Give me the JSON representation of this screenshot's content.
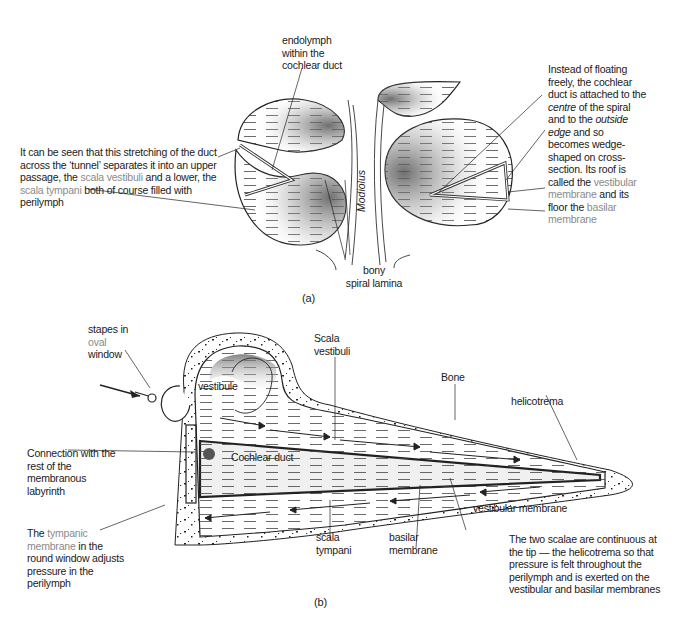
{
  "figure_a": {
    "caption": "(a)",
    "labels": {
      "endolymph": [
        "endolymph",
        "within the",
        "cochlear duct"
      ],
      "tunnel_text": {
        "line1": "It can be seen that this stretching of the duct",
        "line2": "across the ‘tunnel’ separates it into an upper",
        "line3_pre": "passage, the ",
        "line3_term": "scala vestibuli",
        "line3_post": " and a lower, the",
        "line4_term": "scala tympani",
        "line4_post": " both of course filled with",
        "line5": "perilymph"
      },
      "modiolus": "Modiolus",
      "bony_spiral_lamina": [
        "bony",
        "spiral lamina"
      ],
      "right_text": {
        "l1": "Instead of floating",
        "l2": "freely, the cochlear",
        "l3": "duct is attached to the",
        "l4_it": "centre",
        "l4_post": " of the spiral",
        "l5_pre": "and to the ",
        "l5_it": "outside",
        "l6_it": "edge",
        "l6_post": " and so",
        "l7": "becomes wedge-",
        "l8": "shaped on cross-",
        "l9": "section. Its roof is",
        "l10_pre": "called the ",
        "l10_term": "vestibular",
        "l11_term": "membrane",
        "l11_post": " and its",
        "l12_pre": "floor the ",
        "l12_term": "basilar",
        "l13_term": "membrane"
      }
    }
  },
  "figure_b": {
    "caption": "(b)",
    "labels": {
      "stapes": {
        "l1": "stapes in",
        "l2_term": "oval",
        "l3": "window"
      },
      "vestibule": "vestibule",
      "scala_vestibuli": [
        "Scala",
        "vestibuli"
      ],
      "bone": "Bone",
      "helicotrema": "helicotrema",
      "connection": [
        "Connection with the",
        "rest of the",
        "membranous",
        "labyrinth"
      ],
      "cochlear_duct": "Cochlear duct",
      "tympanic": {
        "l1_pre": "The ",
        "l1_term": "tympanic",
        "l2_term": "membrane",
        "l2_post": " in the",
        "l3": "round window adjusts",
        "l4": "pressure in the",
        "l5": "perilymph"
      },
      "scala_tympani": [
        "scala",
        "tympani"
      ],
      "basilar_membrane": [
        "basilar",
        "membrane"
      ],
      "vestibular_membrane": "vestibular membrane",
      "note": [
        "The two scalae are continuous at",
        "the tip — the helicotrema so that",
        "pressure is felt throughout the",
        "perilymph and is exerted on the",
        "vestibular and basilar membranes"
      ]
    }
  },
  "colors": {
    "ink": "#1a1a1a",
    "highlight_term": "#8a8a8a",
    "background": "#ffffff"
  }
}
